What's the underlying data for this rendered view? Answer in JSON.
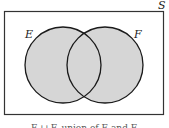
{
  "diagram": {
    "type": "venn",
    "universe_label": "S",
    "sets": [
      {
        "label": "E",
        "cx": 63,
        "cy": 65,
        "r": 38
      },
      {
        "label": "F",
        "cx": 105,
        "cy": 65,
        "r": 38
      }
    ],
    "shaded_region": "E ∪ F",
    "caption": "E ∪ F, union of E and F",
    "colors": {
      "shade": "#d6d6d6",
      "stroke": "#1a1a1a",
      "frame": "#333333"
    }
  }
}
